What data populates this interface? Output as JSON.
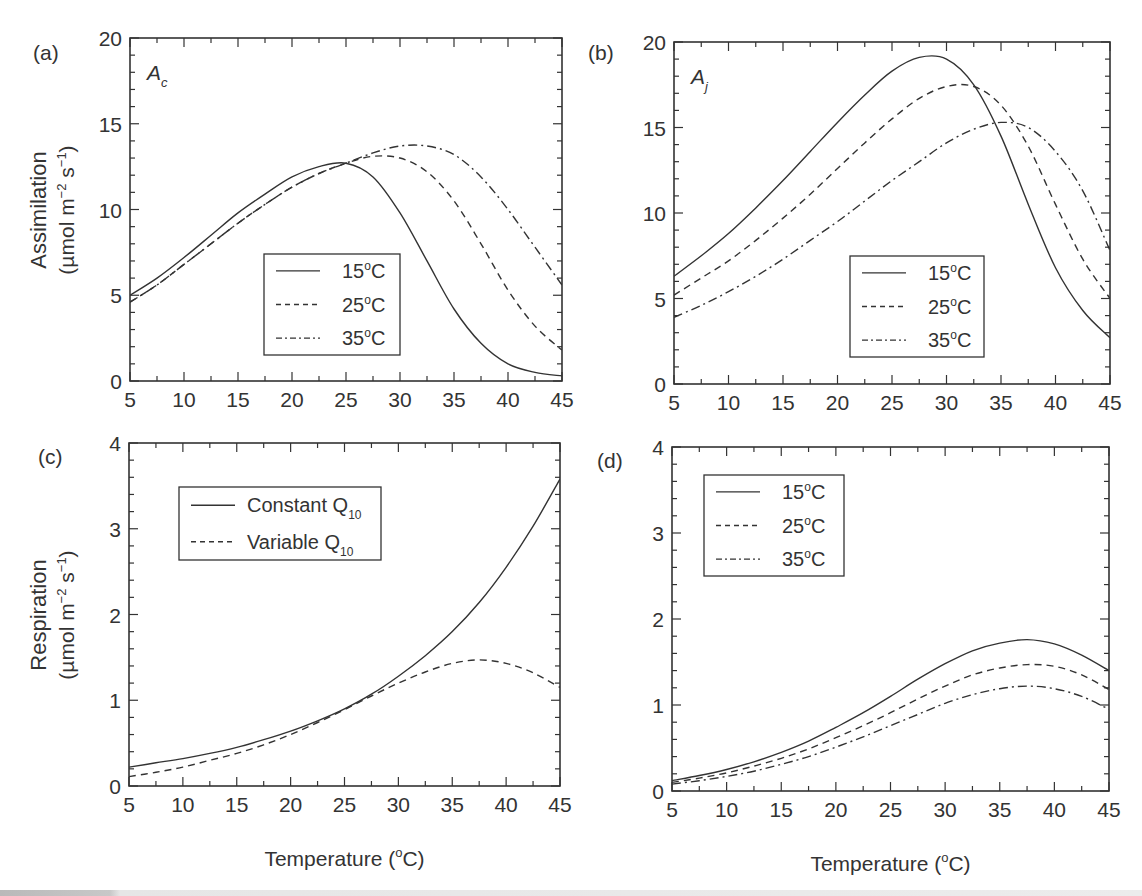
{
  "figure": {
    "xlabel": "Temperature (°C)",
    "ylabel_top_line1": "Assimilation",
    "ylabel_top_line2": "(µmol m⁻² s⁻¹)",
    "ylabel_bottom_line1": "Respiration",
    "ylabel_bottom_line2": "(µmol m⁻² s⁻¹)"
  },
  "chart_data": [
    {
      "panel": "(a)",
      "type": "line",
      "annotation": "A_c",
      "annotation_main": "A",
      "annotation_sub": "c",
      "xlabel": "",
      "ylabel": "Assimilation (µmol m⁻² s⁻¹)",
      "xlim": [
        5,
        45
      ],
      "ylim": [
        0,
        20
      ],
      "xticks": [
        5,
        10,
        15,
        20,
        25,
        30,
        35,
        40,
        45
      ],
      "yticks": [
        0,
        5,
        10,
        15,
        20
      ],
      "grid": false,
      "legend_position": "center-lower",
      "x": [
        5,
        7.5,
        10,
        12.5,
        15,
        17.5,
        20,
        22.5,
        25,
        27.5,
        30,
        32.5,
        35,
        37.5,
        40,
        42.5,
        45
      ],
      "series": [
        {
          "name": "15°C",
          "style": "solid",
          "values": [
            5.0,
            6.0,
            7.2,
            8.5,
            9.8,
            10.9,
            11.9,
            12.5,
            12.7,
            11.9,
            9.8,
            7.0,
            4.2,
            2.2,
            1.0,
            0.5,
            0.3
          ]
        },
        {
          "name": "25°C",
          "style": "dashed",
          "values": [
            4.6,
            5.6,
            6.8,
            8.0,
            9.2,
            10.3,
            11.3,
            12.1,
            12.7,
            13.1,
            13.0,
            12.2,
            10.5,
            8.0,
            5.3,
            3.2,
            1.8
          ]
        },
        {
          "name": "35°C",
          "style": "dashdot",
          "values": [
            4.6,
            5.6,
            6.8,
            8.0,
            9.2,
            10.3,
            11.3,
            12.1,
            12.7,
            13.3,
            13.7,
            13.7,
            13.2,
            11.9,
            10.0,
            7.8,
            5.6
          ]
        }
      ]
    },
    {
      "panel": "(b)",
      "type": "line",
      "annotation": "A_j",
      "annotation_main": "A",
      "annotation_sub": "j",
      "xlabel": "",
      "ylabel": "",
      "xlim": [
        5,
        45
      ],
      "ylim": [
        0,
        20
      ],
      "xticks": [
        5,
        10,
        15,
        20,
        25,
        30,
        35,
        40,
        45
      ],
      "yticks": [
        0,
        5,
        10,
        15,
        20
      ],
      "grid": false,
      "legend_position": "lower-right",
      "x": [
        5,
        7.5,
        10,
        12.5,
        15,
        17.5,
        20,
        22.5,
        25,
        27.5,
        30,
        32.5,
        35,
        37.5,
        40,
        42.5,
        45
      ],
      "series": [
        {
          "name": "15°C",
          "style": "solid",
          "values": [
            6.3,
            7.5,
            8.8,
            10.3,
            11.9,
            13.6,
            15.3,
            16.9,
            18.3,
            19.1,
            19.0,
            17.5,
            14.5,
            10.5,
            6.8,
            4.3,
            2.7
          ]
        },
        {
          "name": "25°C",
          "style": "dashed",
          "values": [
            5.2,
            6.2,
            7.2,
            8.4,
            9.7,
            11.1,
            12.6,
            14.1,
            15.5,
            16.7,
            17.4,
            17.4,
            16.3,
            13.9,
            10.5,
            7.3,
            5.0
          ]
        },
        {
          "name": "35°C",
          "style": "dashdot",
          "values": [
            3.9,
            4.6,
            5.4,
            6.3,
            7.3,
            8.4,
            9.5,
            10.7,
            11.9,
            13.0,
            14.1,
            14.9,
            15.3,
            15.0,
            13.6,
            11.3,
            7.8
          ]
        }
      ]
    },
    {
      "panel": "(c)",
      "type": "line",
      "xlabel": "Temperature (°C)",
      "ylabel": "Respiration (µmol m⁻² s⁻¹)",
      "xlim": [
        5,
        45
      ],
      "ylim": [
        0,
        4
      ],
      "xticks": [
        5,
        10,
        15,
        20,
        25,
        30,
        35,
        40,
        45
      ],
      "yticks": [
        0,
        1,
        2,
        3,
        4
      ],
      "grid": false,
      "legend_position": "upper-left",
      "x": [
        5,
        7.5,
        10,
        12.5,
        15,
        17.5,
        20,
        22.5,
        25,
        27.5,
        30,
        32.5,
        35,
        37.5,
        40,
        42.5,
        45
      ],
      "series": [
        {
          "name": "Constant Q10",
          "legend_main": "Constant Q",
          "legend_sub": "10",
          "style": "solid",
          "values": [
            0.22,
            0.27,
            0.32,
            0.38,
            0.45,
            0.54,
            0.64,
            0.76,
            0.9,
            1.07,
            1.28,
            1.52,
            1.8,
            2.14,
            2.55,
            3.03,
            3.58
          ]
        },
        {
          "name": "Variable Q10",
          "legend_main": "Variable Q",
          "legend_sub": "10",
          "style": "dashed",
          "values": [
            0.11,
            0.16,
            0.22,
            0.3,
            0.38,
            0.48,
            0.6,
            0.74,
            0.89,
            1.05,
            1.2,
            1.33,
            1.43,
            1.47,
            1.43,
            1.32,
            1.15
          ]
        }
      ]
    },
    {
      "panel": "(d)",
      "type": "line",
      "xlabel": "Temperature (°C)",
      "ylabel": "",
      "xlim": [
        5,
        45
      ],
      "ylim": [
        0,
        4
      ],
      "xticks": [
        5,
        10,
        15,
        20,
        25,
        30,
        35,
        40,
        45
      ],
      "yticks": [
        0,
        1,
        2,
        3,
        4
      ],
      "grid": false,
      "legend_position": "upper-left",
      "x": [
        5,
        7.5,
        10,
        12.5,
        15,
        17.5,
        20,
        22.5,
        25,
        27.5,
        30,
        32.5,
        35,
        37.5,
        40,
        42.5,
        45
      ],
      "series": [
        {
          "name": "15°C",
          "style": "solid",
          "values": [
            0.12,
            0.18,
            0.25,
            0.34,
            0.45,
            0.58,
            0.74,
            0.91,
            1.1,
            1.3,
            1.48,
            1.63,
            1.72,
            1.76,
            1.71,
            1.58,
            1.4
          ]
        },
        {
          "name": "25°C",
          "style": "dashed",
          "values": [
            0.1,
            0.15,
            0.21,
            0.29,
            0.38,
            0.49,
            0.62,
            0.76,
            0.91,
            1.07,
            1.22,
            1.35,
            1.43,
            1.47,
            1.45,
            1.35,
            1.18
          ]
        },
        {
          "name": "35°C",
          "style": "dashdot",
          "values": [
            0.08,
            0.12,
            0.17,
            0.23,
            0.31,
            0.4,
            0.51,
            0.63,
            0.76,
            0.89,
            1.02,
            1.12,
            1.19,
            1.22,
            1.19,
            1.1,
            0.95
          ]
        }
      ]
    }
  ],
  "layout": {
    "panels": [
      {
        "left": 130,
        "top": 38,
        "right": 562,
        "bottom": 381,
        "label_x": 33,
        "label_y": 52,
        "legend": {
          "x": 264,
          "y": 254,
          "w": 136,
          "h": 101
        }
      },
      {
        "left": 674,
        "top": 42,
        "right": 1110,
        "bottom": 384,
        "label_x": 588,
        "label_y": 52,
        "legend": {
          "x": 850,
          "y": 256,
          "w": 134,
          "h": 101
        }
      },
      {
        "left": 129,
        "top": 443,
        "right": 560,
        "bottom": 786,
        "label_x": 38,
        "label_y": 456,
        "legend": {
          "x": 179,
          "y": 487,
          "w": 202,
          "h": 73
        }
      },
      {
        "left": 672,
        "top": 447,
        "right": 1109,
        "bottom": 791,
        "label_x": 597,
        "label_y": 460,
        "legend": {
          "x": 704,
          "y": 475,
          "w": 140,
          "h": 101
        }
      }
    ],
    "line_color": "#333333"
  }
}
